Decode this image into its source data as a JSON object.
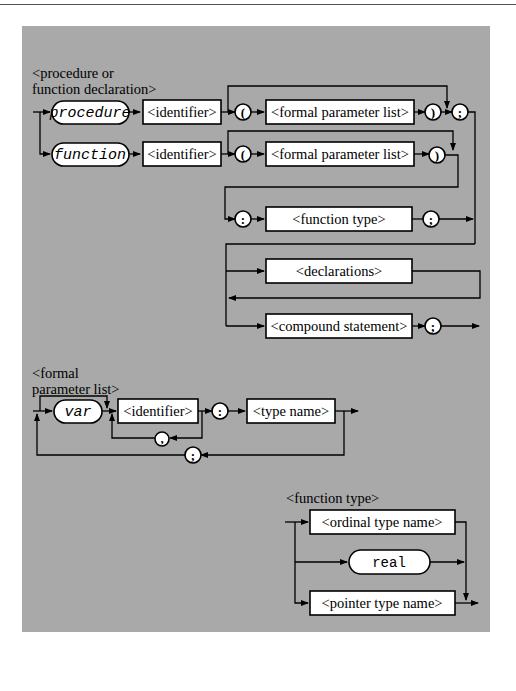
{
  "diagrams": [
    {
      "title_line1": "<procedure or",
      "title_line2": "function declaration>",
      "elements": {
        "procedure_keyword": "procedure",
        "function_keyword": "function",
        "identifier_1": "<identifier>",
        "identifier_2": "<identifier>",
        "lparen_1": "(",
        "lparen_2": "(",
        "formal_param_list_1": "<formal parameter list>",
        "formal_param_list_2": "<formal parameter list>",
        "rparen_1": ")",
        "rparen_2": ")",
        "semicolon_1": ";",
        "colon": ":",
        "function_type": "<function type>",
        "semicolon_2": ";",
        "declarations": "<declarations>",
        "compound_statement": "<compound statement>",
        "semicolon_3": ";"
      }
    },
    {
      "title_line1": "<formal",
      "title_line2": "parameter list>",
      "elements": {
        "var_keyword": "var",
        "identifier": "<identifier>",
        "comma": ",",
        "colon": ":",
        "type_name": "<type name>",
        "semicolon": ";"
      }
    },
    {
      "title_line1": "<function type>",
      "elements": {
        "ordinal_type_name": "<ordinal type name>",
        "real_keyword": "real",
        "pointer_type_name": "<pointer type name>"
      }
    }
  ],
  "colors": {
    "panel_background": "#a9a9a9",
    "box_fill": "#ffffff",
    "line": "#000000"
  }
}
